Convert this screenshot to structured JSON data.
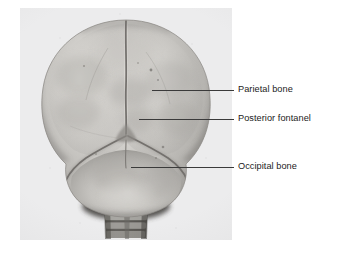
{
  "figure": {
    "kind": "anatomical-photograph",
    "view": "posterior-superior",
    "tone": "grayscale halftone photograph"
  },
  "photo": {
    "background_color": "#ececed",
    "bone_light_color": "#d8d6d2",
    "bone_mid_color": "#b9b7b3",
    "bone_shadow_color": "#8d8b88",
    "suture_color": "#6d6a66",
    "vertebra_color": "#9a9794",
    "frame": {
      "x": 20,
      "y": 8,
      "width": 212,
      "height": 232
    }
  },
  "annotations": [
    {
      "id": "parietal-bone",
      "label": "Parietal bone",
      "leader": {
        "x1": 152,
        "y1": 90,
        "x2": 234,
        "y2": 90
      },
      "text_pos": {
        "x": 238,
        "y": 84
      }
    },
    {
      "id": "posterior-fontanel",
      "label": "Posterior fontanel",
      "leader": {
        "x1": 139,
        "y1": 119,
        "x2": 234,
        "y2": 119
      },
      "text_pos": {
        "x": 238,
        "y": 113
      }
    },
    {
      "id": "occipital-bone",
      "label": "Occipital bone",
      "leader": {
        "x1": 131,
        "y1": 167,
        "x2": 234,
        "y2": 167
      },
      "text_pos": {
        "x": 238,
        "y": 161
      }
    }
  ],
  "colors": {
    "leader_line": "#3a3a3a",
    "label_text": "#1b1b1b",
    "page_background": "#ffffff"
  }
}
